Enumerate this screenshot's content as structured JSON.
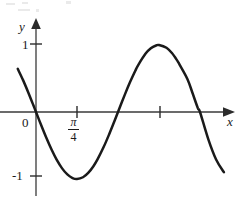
{
  "figure": {
    "kind": "cartesian-plot",
    "background_color": "#ffffff",
    "ink_color": "#1a1a1a",
    "axis_color": "#3a3a3a"
  },
  "labels": {
    "y_axis": "y",
    "x_axis": "x",
    "origin": "0",
    "y_tick_positive": "1",
    "y_tick_negative": "-1",
    "x_tick_pi_numerator": "π",
    "x_tick_pi_denominator": "4"
  },
  "chart_data": {
    "type": "line",
    "title": "",
    "subtitle": "",
    "xlabel": "x",
    "ylabel": "y",
    "grid": false,
    "legend": null,
    "legend_position": "none",
    "xlim": [
      -0.35,
      3.6
    ],
    "ylim": [
      -1.6,
      1.6
    ],
    "x_tick_labels": [
      "π/4",
      ""
    ],
    "x_tick_values": [
      0.7854,
      2.3562
    ],
    "y_tick_labels": [
      "1",
      "0",
      "-1"
    ],
    "y_tick_values": [
      1,
      0,
      -1
    ],
    "annotations": [],
    "series": [
      {
        "name": "y = -sin(2x)",
        "x": [
          -0.35,
          -0.25,
          -0.15,
          -0.05,
          0.0,
          0.1,
          0.2,
          0.3,
          0.3927,
          0.5,
          0.6,
          0.7,
          0.7854,
          0.9,
          1.0,
          1.1,
          1.1781,
          1.3,
          1.4,
          1.5,
          1.5708,
          1.7,
          1.8,
          1.9,
          1.9635,
          2.1,
          2.2,
          2.3,
          2.3562,
          2.5,
          2.6,
          2.7,
          2.75,
          2.9,
          3.0,
          3.1,
          3.1416,
          3.3,
          3.45,
          3.6
        ],
        "y": [
          0.6442,
          0.4794,
          0.2955,
          0.0998,
          0.0,
          -0.1987,
          -0.3894,
          -0.5646,
          -0.7071,
          -0.8415,
          -0.932,
          -0.9854,
          -1.0,
          -0.9738,
          -0.9093,
          -0.8085,
          -0.7071,
          -0.5155,
          -0.335,
          -0.1411,
          0.0,
          0.2555,
          0.4425,
          0.6119,
          0.7071,
          0.8716,
          0.9516,
          0.9927,
          1.0,
          0.9589,
          0.8835,
          0.7739,
          0.7087,
          0.4941,
          0.2794,
          0.0584,
          0.0,
          -0.4048,
          -0.7087,
          -0.8987
        ]
      }
    ]
  },
  "geometry": {
    "origin_px": [
      36,
      112
    ],
    "x_axis_y_px": 112,
    "y_axis_x_px": 36,
    "x_unit_px": 52.2,
    "y_unit_px": 67,
    "curve_path": "M 8.0 62.0 C 14.6 74.5 22.5 92.5 30.8 105.3 C 38.6 117.3 47.0 135.3 55.0 149.5 C 62.0 161.9 69.5 171.8 76.5 175.5 C 81.0 177.9 86.0 177.6 90.5 174.6 C 97.5 169.9 104.5 159.0 111.0 146.0 C 118.0 132.0 125.5 116.0 132.0 101.5 C 138.5 87.0 145.5 68.0 152.0 55.5 C 155.5 48.8 159.5 44.2 163.5 44.6 C 167.5 45.0 171.0 50.4 174.5 57.5 C 181.0 70.8 188.0 89.5 194.5 103.0 C 201.0 116.5 208.5 133.5 215.5 145.5 C 222.0 156.6 228.0 161.6 234.0 163.5",
    "y_axis_line": {
      "x": 36,
      "y_top": 28,
      "y_bottom": 196
    },
    "x_axis_line": {
      "y": 112,
      "x_left": 0,
      "x_right": 224
    },
    "ticks": {
      "y_positive_px": 44,
      "y_negative_px": 176,
      "x_pi_over_4_px": 77,
      "x_second_px": 160
    }
  }
}
